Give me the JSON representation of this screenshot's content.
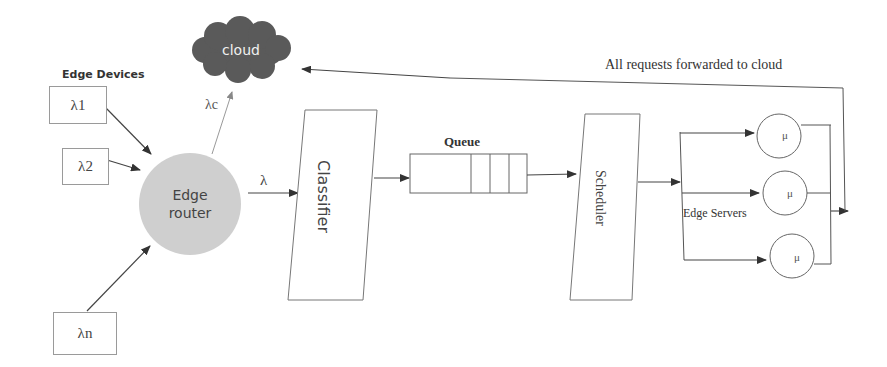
{
  "diagram": {
    "edge_devices": {
      "title": "Edge Devices",
      "items": [
        {
          "label": "λ1"
        },
        {
          "label": "λ2"
        },
        {
          "label": "λn"
        }
      ]
    },
    "cloud": {
      "label": "cloud",
      "arrival_label": "λc"
    },
    "edge_router": {
      "line1": "Edge",
      "line2": "router",
      "output_label": "λ"
    },
    "classifier": {
      "label": "Classifier"
    },
    "queue": {
      "label": "Queue",
      "slots": 3
    },
    "scheduler": {
      "label": "Scheduler"
    },
    "edge_servers": {
      "label": "Edge Servers",
      "servers": [
        {
          "rate": "μ"
        },
        {
          "rate": "μ"
        },
        {
          "rate": "μ"
        }
      ]
    },
    "forward_label": "All requests forwarded to cloud",
    "colors": {
      "cloud_fill": "#5a5a5a",
      "router_fill": "#cfcfcf",
      "line": "#555555",
      "box_border": "#9a9a9a"
    }
  }
}
